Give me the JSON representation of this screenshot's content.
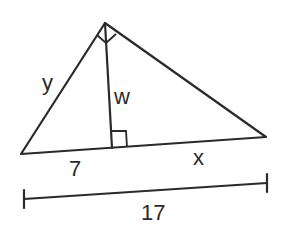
{
  "diagram": {
    "type": "right-triangle-with-altitude",
    "labels": {
      "hypotenuse_left_side": "y",
      "altitude": "w",
      "left_segment": "7",
      "right_segment": "x",
      "total_base": "17"
    },
    "colors": {
      "stroke": "#2a2a2a",
      "background": "#ffffff"
    }
  }
}
